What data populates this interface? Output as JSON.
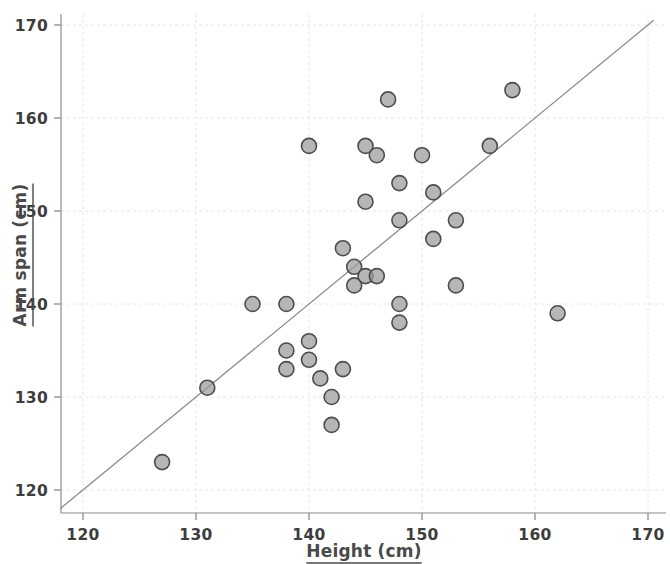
{
  "chart_data": {
    "type": "scatter",
    "title": "",
    "xlabel": "Height (cm)",
    "ylabel": "Arm span (cm)",
    "xlim": [
      117,
      172
    ],
    "ylim": [
      118,
      172
    ],
    "xticks": [
      120,
      130,
      140,
      150,
      160,
      170
    ],
    "yticks": [
      120,
      130,
      140,
      150,
      160,
      170
    ],
    "xtick_labels": [
      "120",
      "130",
      "140",
      "150",
      "160",
      "170"
    ],
    "ytick_labels": [
      "120",
      "130",
      "140",
      "150",
      "160",
      "170"
    ],
    "grid": true,
    "legend": null,
    "marker": {
      "shape": "circle",
      "fill_color": "#9a9a9a",
      "edge_color": "#4d4d4d",
      "size_px": 15
    },
    "trend_line": {
      "type": "identity-reference-line",
      "color": "#8c8c8c",
      "x_start": 118.0,
      "y_start": 118.0,
      "x_end": 170.5,
      "y_end": 170.5
    },
    "points": [
      {
        "x": 127,
        "y": 123
      },
      {
        "x": 131,
        "y": 131
      },
      {
        "x": 135,
        "y": 140
      },
      {
        "x": 138,
        "y": 140
      },
      {
        "x": 138,
        "y": 135
      },
      {
        "x": 138,
        "y": 133
      },
      {
        "x": 140,
        "y": 157
      },
      {
        "x": 140,
        "y": 136
      },
      {
        "x": 140,
        "y": 134
      },
      {
        "x": 141,
        "y": 132
      },
      {
        "x": 142,
        "y": 130
      },
      {
        "x": 142,
        "y": 127
      },
      {
        "x": 143,
        "y": 146
      },
      {
        "x": 143,
        "y": 133
      },
      {
        "x": 144,
        "y": 144
      },
      {
        "x": 144,
        "y": 142
      },
      {
        "x": 145,
        "y": 157
      },
      {
        "x": 145,
        "y": 151
      },
      {
        "x": 145,
        "y": 143
      },
      {
        "x": 146,
        "y": 156
      },
      {
        "x": 146,
        "y": 143
      },
      {
        "x": 147,
        "y": 162
      },
      {
        "x": 148,
        "y": 153
      },
      {
        "x": 148,
        "y": 149
      },
      {
        "x": 148,
        "y": 140
      },
      {
        "x": 148,
        "y": 138
      },
      {
        "x": 150,
        "y": 156
      },
      {
        "x": 151,
        "y": 152
      },
      {
        "x": 151,
        "y": 147
      },
      {
        "x": 153,
        "y": 149
      },
      {
        "x": 153,
        "y": 142
      },
      {
        "x": 156,
        "y": 157
      },
      {
        "x": 158,
        "y": 163
      },
      {
        "x": 162,
        "y": 139
      }
    ]
  },
  "colors": {
    "axis": "#8c8c8c",
    "grid": "#e6e6e6",
    "text": "#3d3d3d",
    "marker_fill": "#9a9a9a",
    "marker_edge": "#4d4d4d",
    "line": "#8c8c8c",
    "background": "#ffffff"
  }
}
